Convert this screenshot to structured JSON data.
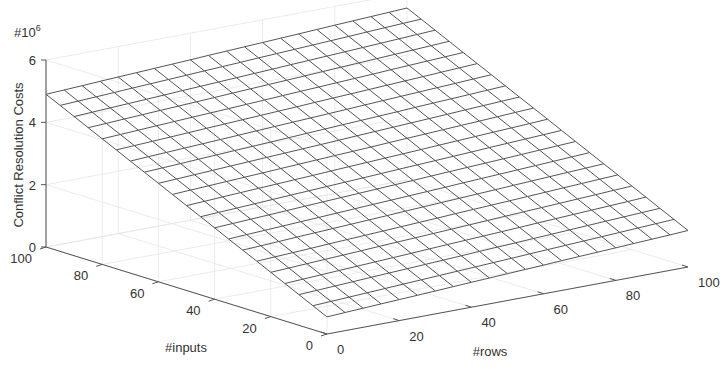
{
  "chart_data": {
    "type": "surface",
    "title": "",
    "xlabel": "#rows",
    "ylabel": "#inputs",
    "zlabel": "Conflict Resolution Costs",
    "z_exponent_label": {
      "base": "#10",
      "exponent": "6"
    },
    "x_range": [
      0,
      100
    ],
    "y_range": [
      0,
      100
    ],
    "z_range": [
      0,
      6
    ],
    "x_ticks": [
      "0",
      "20",
      "40",
      "60",
      "80",
      "100"
    ],
    "y_ticks": [
      "0",
      "20",
      "40",
      "60",
      "80",
      "100"
    ],
    "z_ticks": [
      "0",
      "2",
      "4",
      "6"
    ],
    "grid": true,
    "mesh_divisions": 20,
    "z_unit_scale": 1000000,
    "surface_model": {
      "description": "approximately planar: z = a + b*inputs + c*rows (in units of 1e6)",
      "a": 0.55,
      "b_per_input": 0.0435,
      "c_per_row": 0.0062
    },
    "corner_values": [
      {
        "rows": 0,
        "inputs": 0,
        "z": 0.55
      },
      {
        "rows": 100,
        "inputs": 0,
        "z": 1.17
      },
      {
        "rows": 0,
        "inputs": 100,
        "z": 4.9
      },
      {
        "rows": 100,
        "inputs": 100,
        "z": 5.52
      }
    ]
  }
}
